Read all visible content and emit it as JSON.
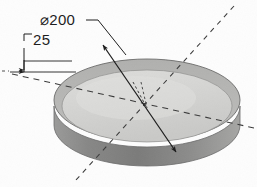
{
  "drawing": {
    "title": "Isometric view of circular disc",
    "part_type": "cylindrical-disc",
    "units_note": "",
    "dimensions": [
      {
        "id": "diameter",
        "label": "⌀200",
        "symbol": "⌀",
        "value": "200",
        "kind": "diameter",
        "leader": "solid-line-with-arrows",
        "text_x": 40,
        "text_y": 24
      },
      {
        "id": "thickness",
        "label": "25",
        "value": "25",
        "kind": "linear-thickness",
        "leader": "extension-lines-with-arrows",
        "text_x": 33,
        "text_y": 45
      }
    ],
    "centerlines": [
      {
        "id": "centerline-major",
        "style": "dashed",
        "direction": "upper-right-to-lower-left"
      },
      {
        "id": "centerline-minor",
        "style": "dashed",
        "direction": "left-to-right"
      },
      {
        "id": "centerline-short",
        "style": "dashed",
        "direction": "upper-left-to-center"
      }
    ],
    "colors": {
      "top_face": "#d2d2d0",
      "top_face_highlight": "#dcdcda",
      "back_rim": "#b4b4b2",
      "front_edge": "#8f8f8e",
      "front_edge_dark": "#7a7a79",
      "outline": "#6e6e6d",
      "line": "#1c1c1c",
      "background": "#fdfdfd"
    },
    "geometry": {
      "center_x": 147,
      "center_y": 108,
      "rx": 93,
      "ry": 41,
      "thickness_px": 27
    }
  }
}
